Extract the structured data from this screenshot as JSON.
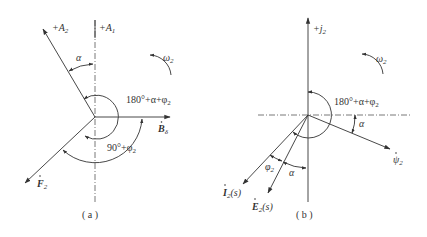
{
  "figure": {
    "panels": [
      {
        "id": "a",
        "caption": "( a )",
        "axes": {
          "vertical_label": "+A",
          "vertical_sub": "1"
        },
        "vectors": [
          {
            "name": "+A",
            "sub": "2",
            "kind": "axis"
          },
          {
            "name": "B",
            "sub": "δ",
            "dot": true
          },
          {
            "name": "F",
            "sub": "2",
            "dot": true
          }
        ],
        "angles": [
          {
            "label": "α"
          },
          {
            "label": "180°+α+φ",
            "sub": "2"
          },
          {
            "label": "90°+φ",
            "sub": "2"
          }
        ],
        "rotation": {
          "label": "ω",
          "sub": "2"
        }
      },
      {
        "id": "b",
        "caption": "( b )",
        "axes": {
          "vertical_label": "+j",
          "vertical_sub": "2"
        },
        "vectors": [
          {
            "name": "ψ",
            "sub": "2",
            "dot": true
          },
          {
            "name": "I",
            "sub": "2",
            "suffix": "(s)",
            "dot": true
          },
          {
            "name": "E",
            "sub": "2",
            "suffix": "(s)",
            "dot": true
          }
        ],
        "angles": [
          {
            "label": "180°+α+φ",
            "sub": "2"
          },
          {
            "label": "α"
          },
          {
            "label": "φ",
            "sub": "2"
          },
          {
            "label": "α"
          }
        ],
        "rotation": {
          "label": "ω",
          "sub": "2"
        }
      }
    ],
    "colors": {
      "line": "#333333",
      "background": "#ffffff"
    }
  }
}
